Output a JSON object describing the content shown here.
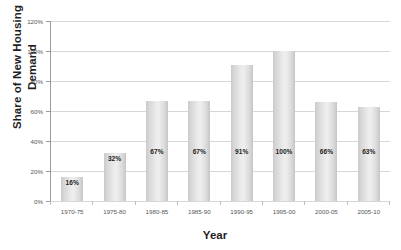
{
  "chart_data": {
    "type": "bar",
    "title": "",
    "xlabel": "Year",
    "ylabel": "Share of New Housing\nDemand",
    "categories": [
      "1970-75",
      "1975-80",
      "1980-85",
      "1985-90",
      "1990-95",
      "1995-00",
      "2000-05",
      "2005-10"
    ],
    "values": [
      16,
      32,
      67,
      67,
      91,
      100,
      66,
      63
    ],
    "data_labels": [
      "16%",
      "32%",
      "67%",
      "67%",
      "91%",
      "100%",
      "66%",
      "63%"
    ],
    "ylim": [
      0,
      120
    ],
    "ytick_values": [
      0,
      20,
      40,
      60,
      80,
      100,
      120
    ],
    "ytick_labels": [
      "0%",
      "20%",
      "40%",
      "60%",
      "80%",
      "100%",
      "120%"
    ],
    "grid": true,
    "legend": null,
    "legend_position": "none",
    "series": [
      {
        "name": "Share of New Housing Demand",
        "values": [
          16,
          32,
          67,
          67,
          91,
          100,
          66,
          63
        ]
      }
    ],
    "colors": {
      "bar_light": "#efefef",
      "bar_mid": "#e0e0e0",
      "bar_edge": "#c6c6c6",
      "gridline": "#d7d7d7",
      "axis_line": "#9a9a9a",
      "tick_text": "#555555",
      "title_text": "#1f1f1f",
      "label_text": "#1c1c1c",
      "background": "#ffffff"
    }
  }
}
